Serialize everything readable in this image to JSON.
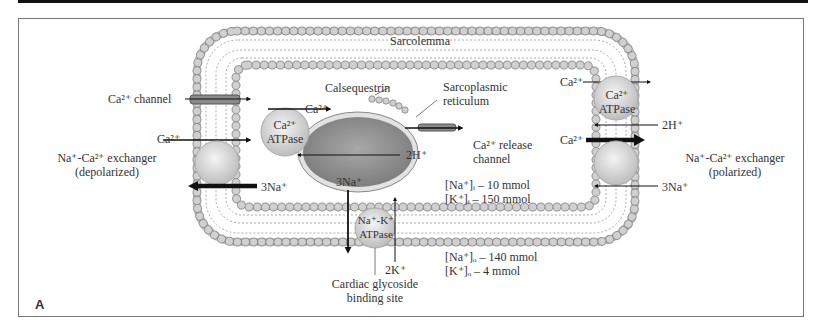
{
  "figure": {
    "panel_label": "A",
    "membrane_label": "Sarcolemma",
    "labels": {
      "ca_channel": "Ca²⁺ channel",
      "ca_in_channel": "",
      "ncx_left_ca": "Ca²⁺",
      "ncx_left_name": "Na⁺-Ca²⁺ exchanger",
      "ncx_left_state": "(depolarized)",
      "ncx_left_na": "3Na⁺",
      "calsequestrin": "Calsequestrin",
      "sr_name_1": "Sarcoplasmic",
      "sr_name_2": "reticulum",
      "serca_ca": "Ca²⁺",
      "serca_name_1": "Ca²⁺",
      "serca_name_2": "ATPase",
      "serca_h": "2H⁺",
      "release_channel_1": "Ca²⁺ release",
      "release_channel_2": "channel",
      "pmca_ca": "Ca²⁺",
      "pmca_name_1": "Ca²⁺",
      "pmca_name_2": "ATPase",
      "pmca_h": "2H⁺",
      "ncx_right_ca": "Ca²⁺",
      "ncx_right_name": "Na⁺-Ca²⁺ exchanger",
      "ncx_right_state": "(polarized)",
      "ncx_right_na": "3Na⁺",
      "nak_na": "3Na⁺",
      "nak_name_1": "Na⁺-K⁺",
      "nak_name_2": "ATPase",
      "nak_k": "2K⁺",
      "glycoside_1": "Cardiac glycoside",
      "glycoside_2": "binding site",
      "intra_na": "[Na⁺]ᵢ – 10 mmol",
      "intra_k": "[K⁺]ᵢ – 150 mmol",
      "extra_na": "[Na⁺]ₒ – 140 mmol",
      "extra_k": "[K⁺]ₒ – 4 mmol"
    },
    "colors": {
      "lipid_head": "#c8c8c8",
      "protein": "#dcdcdc",
      "sr_body": "#9a9a9a",
      "arrow": "#111111",
      "frame": "#777777",
      "text": "#333333"
    }
  }
}
